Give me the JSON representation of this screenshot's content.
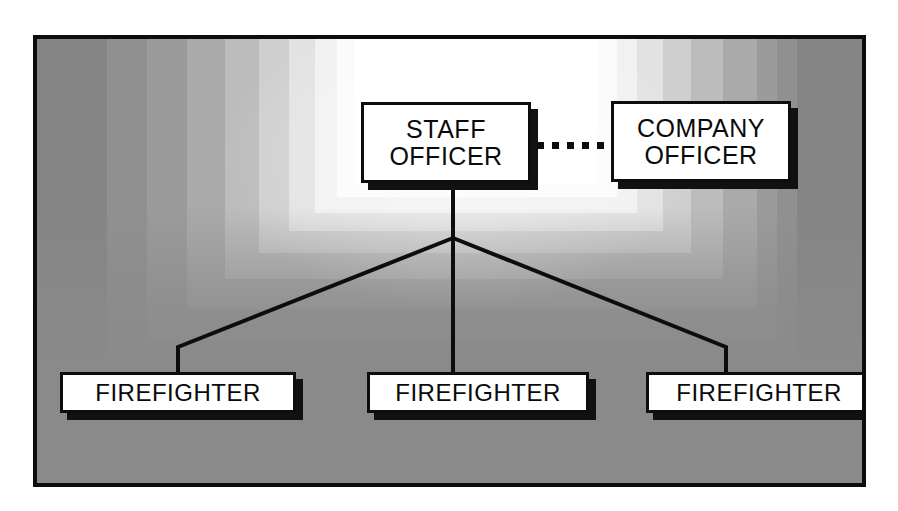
{
  "diagram": {
    "frame": {
      "border_color": "#0d0d0d",
      "background_color": "#8a8a8a"
    },
    "nodes": [
      {
        "id": "staff-officer",
        "label": "STAFF\nOFFICER",
        "line1": "STAFF",
        "line2": "OFFICER",
        "row": "top",
        "fill": "#ffffff",
        "border": "#0d0d0d",
        "shadow": "#111111"
      },
      {
        "id": "company-officer",
        "label": "COMPANY\nOFFICER",
        "line1": "COMPANY",
        "line2": "OFFICER",
        "row": "top",
        "fill": "#ffffff",
        "border": "#0d0d0d",
        "shadow": "#111111"
      },
      {
        "id": "firefighter-1",
        "label": "FIREFIGHTER",
        "row": "bottom",
        "fill": "#ffffff",
        "border": "#0d0d0d",
        "shadow": "#111111"
      },
      {
        "id": "firefighter-2",
        "label": "FIREFIGHTER",
        "row": "bottom",
        "fill": "#ffffff",
        "border": "#0d0d0d",
        "shadow": "#111111"
      },
      {
        "id": "firefighter-3",
        "label": "FIREFIGHTER",
        "row": "bottom",
        "fill": "#ffffff",
        "border": "#0d0d0d",
        "shadow": "#111111"
      }
    ],
    "connectors": [
      {
        "id": "staff-to-company",
        "from": "staff-officer",
        "to": "company-officer",
        "style": "dotted",
        "orientation": "horizontal",
        "dot_count": 5,
        "color": "#0d0d0d"
      },
      {
        "id": "staff-to-firefighter-1",
        "from": "staff-officer",
        "to": "firefighter-1",
        "style": "solid",
        "color": "#0d0d0d"
      },
      {
        "id": "staff-to-firefighter-2",
        "from": "staff-officer",
        "to": "firefighter-2",
        "style": "solid",
        "color": "#0d0d0d"
      },
      {
        "id": "staff-to-firefighter-3",
        "from": "staff-officer",
        "to": "firefighter-3",
        "style": "solid",
        "color": "#0d0d0d"
      }
    ],
    "glow_bands": [
      "#858585",
      "#909090",
      "#9b9b9b",
      "#aaaaaa",
      "#bcbcbc",
      "#cfcfcf",
      "#e2e2e2",
      "#f1f1f1",
      "#fbfbfb",
      "#ffffff"
    ]
  }
}
